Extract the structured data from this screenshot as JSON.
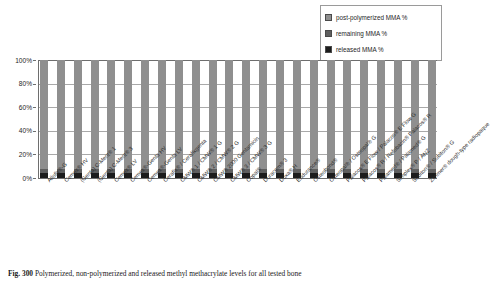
{
  "chart_data": {
    "type": "bar",
    "subtype": "stacked-100-percent",
    "title": "",
    "xlabel": "",
    "ylabel": "",
    "ylim": [
      0,
      100
    ],
    "ytick_labels": [
      "0%",
      "20%",
      "40%",
      "60%",
      "80%",
      "100%"
    ],
    "ytick_values": [
      0,
      20,
      40,
      60,
      80,
      100
    ],
    "grid": true,
    "legend_position": "top-right",
    "categories": [
      "Allofix®-G",
      "Cemex® HV",
      "(Genta) C-Ment® 1",
      "(Genta) C-Ment® 3",
      "Cemex® LV",
      "Cemex®-Genta HV",
      "Cemex®-Genta LV",
      "Cerafix® / Cerafixgenta",
      "CMW® 1 / CMW® 1 G",
      "CMW® 2 / CMW® 2 G",
      "CMW® 2000 Gentamicin",
      "CMW® 3 / CMW® 3 G",
      "Copal®",
      "Duracem® 3",
      "Duxa® H",
      "Endurance®",
      "Osteobond®",
      "Osteopal® / Osteopal® G",
      "Palacos® E Flow / Palacos® E Flow G",
      "Palacos® R / Refobacin® Palacos® R",
      "Palamed® / Palamed® G",
      "Simplex® P / ANZ",
      "Subiton® / Subiton® G",
      "Zimmer® dough-type radiopaque"
    ],
    "series": [
      {
        "name": "post-polymerized MMA %",
        "color": "#8f8f8f",
        "values": [
          92,
          92,
          92,
          92,
          92,
          92,
          92,
          92,
          92,
          92,
          92,
          92,
          92,
          92,
          92,
          92,
          92,
          92,
          92,
          92,
          92,
          92,
          92,
          92
        ]
      },
      {
        "name": "remaining MMA %",
        "color": "#5f5f5f",
        "values": [
          4,
          4,
          4,
          4,
          4,
          4,
          4,
          4,
          4,
          4,
          4,
          4,
          4,
          4,
          4,
          4,
          4,
          4,
          4,
          4,
          4,
          4,
          4,
          4
        ]
      },
      {
        "name": "released MMA %",
        "color": "#1c1c1c",
        "values": [
          4,
          4,
          4,
          4,
          4,
          4,
          4,
          4,
          4,
          4,
          4,
          4,
          4,
          4,
          4,
          4,
          4,
          4,
          4,
          4,
          4,
          4,
          4,
          4
        ]
      }
    ]
  },
  "legend": {
    "items": [
      {
        "label": "post-polymerized MMA %",
        "color": "#8f8f8f"
      },
      {
        "label": "remaining MMA %",
        "color": "#5f5f5f"
      },
      {
        "label": "released MMA %",
        "color": "#1c1c1c"
      }
    ]
  },
  "caption": {
    "figure_number": "Fig. 300",
    "text": "Polymerized, non-polymerized and released methyl methacrylate levels for all tested bone"
  }
}
